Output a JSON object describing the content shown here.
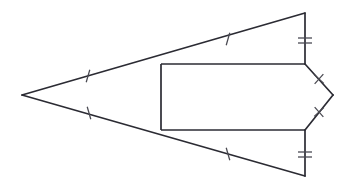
{
  "figure": {
    "canvas": {
      "width": 348,
      "height": 189,
      "background": "#ffffff"
    },
    "stroke_color": "#2b2b33",
    "tick_color": "#4a4a52",
    "stroke_width": 1.7,
    "points": {
      "apex": {
        "name": "left-apex",
        "x": 22,
        "y": 95
      },
      "top_vertex": {
        "name": "top-vertex",
        "x": 305,
        "y": 13
      },
      "bottom_vertex": {
        "name": "bottom-vertex",
        "x": 305,
        "y": 176
      },
      "rect_top_left": {
        "name": "rectangle-top-left",
        "x": 161,
        "y": 64
      },
      "rect_top_right": {
        "name": "rectangle-top-right",
        "x": 305,
        "y": 64
      },
      "rect_bottom_right": {
        "name": "rectangle-bottom-right",
        "x": 305,
        "y": 130
      },
      "rect_bottom_left": {
        "name": "rectangle-bottom-left",
        "x": 161,
        "y": 130
      },
      "chevron_tip": {
        "name": "chevron-tip",
        "x": 333,
        "y": 95
      }
    },
    "edges": [
      {
        "name": "upper-long-edge",
        "from": "apex",
        "to": "top_vertex",
        "ticks": 1,
        "tick_style": "slash"
      },
      {
        "name": "lower-long-edge",
        "from": "apex",
        "to": "bottom_vertex",
        "ticks": 1,
        "tick_style": "slash"
      },
      {
        "name": "upper-vertical-edge",
        "from": "top_vertex",
        "to": "rect_top_right",
        "ticks": 2,
        "tick_style": "double-bar"
      },
      {
        "name": "lower-vertical-edge",
        "from": "rect_bottom_right",
        "to": "bottom_vertex",
        "ticks": 2,
        "tick_style": "double-bar"
      },
      {
        "name": "rectangle-top-edge",
        "from": "rect_top_left",
        "to": "rect_top_right",
        "ticks": 0,
        "tick_style": "none"
      },
      {
        "name": "rectangle-bottom-edge",
        "from": "rect_bottom_left",
        "to": "rect_bottom_right",
        "ticks": 0,
        "tick_style": "none"
      },
      {
        "name": "rectangle-left-edge",
        "from": "rect_top_left",
        "to": "rect_bottom_left",
        "ticks": 0,
        "tick_style": "none"
      },
      {
        "name": "chevron-upper-edge",
        "from": "rect_top_right",
        "to": "chevron_tip",
        "ticks": 1,
        "tick_style": "cross"
      },
      {
        "name": "chevron-lower-edge",
        "from": "chevron_tip",
        "to": "rect_bottom_right",
        "ticks": 1,
        "tick_style": "cross"
      }
    ],
    "tick_marks": [
      {
        "name": "tick-upper-long-edge",
        "x": 88,
        "y": 76,
        "style": "slash",
        "length": 13,
        "angle": 106
      },
      {
        "name": "tick-lower-long-edge",
        "x": 89,
        "y": 113,
        "style": "slash",
        "length": 13,
        "angle": 74
      },
      {
        "name": "tick-upper-slant-edge",
        "x": 228,
        "y": 39,
        "style": "slash",
        "length": 13,
        "angle": 106
      },
      {
        "name": "tick-lower-slant-edge",
        "x": 228,
        "y": 154,
        "style": "slash",
        "length": 13,
        "angle": 74
      },
      {
        "name": "tick-upper-vertical-a",
        "x": 305,
        "y": 38,
        "style": "bar",
        "length": 14,
        "angle": 0
      },
      {
        "name": "tick-upper-vertical-b",
        "x": 305,
        "y": 43,
        "style": "bar",
        "length": 14,
        "angle": 0
      },
      {
        "name": "tick-lower-vertical-a",
        "x": 305,
        "y": 152,
        "style": "bar",
        "length": 14,
        "angle": 0
      },
      {
        "name": "tick-lower-vertical-b",
        "x": 305,
        "y": 157,
        "style": "bar",
        "length": 14,
        "angle": 0
      },
      {
        "name": "tick-chevron-upper",
        "x": 319,
        "y": 79,
        "style": "cross",
        "length": 13,
        "angle": 132
      },
      {
        "name": "tick-chevron-lower",
        "x": 319,
        "y": 112,
        "style": "cross",
        "length": 13,
        "angle": 48
      }
    ]
  }
}
